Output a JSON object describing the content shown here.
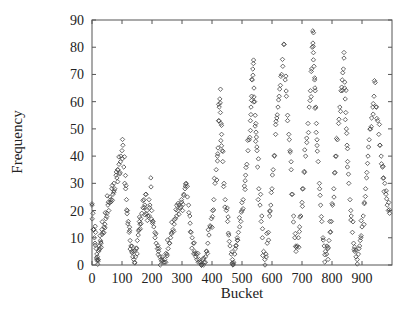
{
  "chart_data": {
    "type": "scatter",
    "title": "",
    "xlabel": "Bucket",
    "ylabel": "Frequency",
    "xlim": [
      0,
      1000
    ],
    "ylim": [
      0,
      90
    ],
    "xticks": [
      0,
      100,
      200,
      300,
      400,
      500,
      600,
      700,
      800,
      900
    ],
    "yticks": [
      0,
      10,
      20,
      30,
      40,
      50,
      60,
      70,
      80,
      90
    ],
    "grid": false,
    "legend": null,
    "marker": "open-diamond",
    "marker_color": "#444444",
    "peaks": [
      {
        "x": 100,
        "y": 44
      },
      {
        "x": 200,
        "y": 32
      },
      {
        "x": 330,
        "y": 30
      },
      {
        "x": 425,
        "y": 61
      },
      {
        "x": 535,
        "y": 74
      },
      {
        "x": 640,
        "y": 81
      },
      {
        "x": 735,
        "y": 86
      },
      {
        "x": 840,
        "y": 76
      },
      {
        "x": 945,
        "y": 67
      }
    ],
    "troughs": [
      {
        "x": 20,
        "y": 2
      },
      {
        "x": 140,
        "y": 1
      },
      {
        "x": 245,
        "y": 1
      },
      {
        "x": 365,
        "y": 0
      },
      {
        "x": 470,
        "y": 0
      },
      {
        "x": 570,
        "y": 2
      },
      {
        "x": 680,
        "y": 4
      },
      {
        "x": 785,
        "y": 4
      },
      {
        "x": 885,
        "y": 2
      }
    ],
    "series": [
      {
        "name": "frequency",
        "points": [
          [
            0,
            22
          ],
          [
            3,
            19
          ],
          [
            5,
            13
          ],
          [
            8,
            10
          ],
          [
            10,
            8
          ],
          [
            12,
            12
          ],
          [
            14,
            6
          ],
          [
            16,
            4
          ],
          [
            18,
            3
          ],
          [
            20,
            2
          ],
          [
            22,
            5
          ],
          [
            24,
            7
          ],
          [
            26,
            6
          ],
          [
            28,
            9
          ],
          [
            30,
            8
          ],
          [
            33,
            13
          ],
          [
            36,
            12
          ],
          [
            40,
            14
          ],
          [
            43,
            15
          ],
          [
            46,
            17
          ],
          [
            50,
            19
          ],
          [
            53,
            22
          ],
          [
            56,
            20
          ],
          [
            60,
            25
          ],
          [
            63,
            24
          ],
          [
            66,
            28
          ],
          [
            70,
            26
          ],
          [
            73,
            30
          ],
          [
            76,
            28
          ],
          [
            80,
            33
          ],
          [
            83,
            32
          ],
          [
            86,
            35
          ],
          [
            90,
            37
          ],
          [
            93,
            34
          ],
          [
            96,
            40
          ],
          [
            100,
            42
          ],
          [
            103,
            44
          ],
          [
            106,
            36
          ],
          [
            109,
            30
          ],
          [
            112,
            28
          ],
          [
            115,
            24
          ],
          [
            118,
            20
          ],
          [
            121,
            16
          ],
          [
            124,
            12
          ],
          [
            127,
            9
          ],
          [
            130,
            7
          ],
          [
            133,
            5
          ],
          [
            136,
            3
          ],
          [
            139,
            2
          ],
          [
            142,
            1
          ],
          [
            145,
            3
          ],
          [
            148,
            6
          ],
          [
            151,
            9
          ],
          [
            154,
            11
          ],
          [
            157,
            13
          ],
          [
            160,
            15
          ],
          [
            163,
            17
          ],
          [
            166,
            19
          ],
          [
            170,
            21
          ],
          [
            173,
            24
          ],
          [
            176,
            22
          ],
          [
            180,
            26
          ],
          [
            183,
            20
          ],
          [
            186,
            18
          ],
          [
            190,
            24
          ],
          [
            193,
            22
          ],
          [
            196,
            32
          ],
          [
            199,
            20
          ],
          [
            202,
            16
          ],
          [
            206,
            14
          ],
          [
            210,
            10
          ],
          [
            214,
            8
          ],
          [
            218,
            6
          ],
          [
            222,
            5
          ],
          [
            226,
            3
          ],
          [
            230,
            2
          ],
          [
            234,
            3
          ],
          [
            238,
            1
          ],
          [
            242,
            2
          ],
          [
            246,
            1
          ],
          [
            250,
            4
          ],
          [
            254,
            6
          ],
          [
            258,
            8
          ],
          [
            262,
            10
          ],
          [
            266,
            12
          ],
          [
            270,
            13
          ],
          [
            274,
            15
          ],
          [
            278,
            17
          ],
          [
            282,
            18
          ],
          [
            286,
            20
          ],
          [
            290,
            22
          ],
          [
            294,
            21
          ],
          [
            298,
            24
          ],
          [
            302,
            20
          ],
          [
            306,
            26
          ],
          [
            310,
            28
          ],
          [
            314,
            30
          ],
          [
            318,
            25
          ],
          [
            322,
            22
          ],
          [
            326,
            18
          ],
          [
            330,
            12
          ],
          [
            334,
            10
          ],
          [
            338,
            8
          ],
          [
            342,
            5
          ],
          [
            346,
            3
          ],
          [
            350,
            2
          ],
          [
            354,
            1
          ],
          [
            358,
            2
          ],
          [
            362,
            1
          ],
          [
            366,
            0
          ],
          [
            370,
            2
          ],
          [
            374,
            1
          ],
          [
            378,
            3
          ],
          [
            382,
            5
          ],
          [
            386,
            8
          ],
          [
            390,
            11
          ],
          [
            394,
            14
          ],
          [
            398,
            17
          ],
          [
            402,
            20
          ],
          [
            406,
            24
          ],
          [
            410,
            30
          ],
          [
            414,
            35
          ],
          [
            418,
            40
          ],
          [
            420,
            43
          ],
          [
            422,
            53
          ],
          [
            424,
            58
          ],
          [
            426,
            61
          ],
          [
            428,
            56
          ],
          [
            430,
            52
          ],
          [
            432,
            48
          ],
          [
            434,
            42
          ],
          [
            436,
            38
          ],
          [
            440,
            30
          ],
          [
            444,
            24
          ],
          [
            448,
            20
          ],
          [
            452,
            16
          ],
          [
            456,
            11
          ],
          [
            460,
            7
          ],
          [
            464,
            4
          ],
          [
            468,
            2
          ],
          [
            470,
            0
          ],
          [
            472,
            1
          ],
          [
            476,
            4
          ],
          [
            480,
            7
          ],
          [
            484,
            10
          ],
          [
            488,
            12
          ],
          [
            492,
            14
          ],
          [
            496,
            16
          ],
          [
            500,
            20
          ],
          [
            504,
            24
          ],
          [
            508,
            29
          ],
          [
            512,
            33
          ],
          [
            516,
            37
          ],
          [
            520,
            42
          ],
          [
            524,
            46
          ],
          [
            528,
            53
          ],
          [
            530,
            58
          ],
          [
            532,
            62
          ],
          [
            534,
            68
          ],
          [
            536,
            72
          ],
          [
            538,
            74
          ],
          [
            540,
            65
          ],
          [
            542,
            60
          ],
          [
            544,
            55
          ],
          [
            546,
            52
          ],
          [
            548,
            47
          ],
          [
            550,
            42
          ],
          [
            552,
            36
          ],
          [
            556,
            28
          ],
          [
            560,
            22
          ],
          [
            564,
            16
          ],
          [
            568,
            10
          ],
          [
            572,
            5
          ],
          [
            576,
            2
          ],
          [
            580,
            4
          ],
          [
            584,
            8
          ],
          [
            588,
            12
          ],
          [
            592,
            18
          ],
          [
            596,
            22
          ],
          [
            600,
            28
          ],
          [
            604,
            35
          ],
          [
            608,
            40
          ],
          [
            612,
            48
          ],
          [
            616,
            54
          ],
          [
            620,
            58
          ],
          [
            624,
            62
          ],
          [
            628,
            66
          ],
          [
            632,
            70
          ],
          [
            636,
            73
          ],
          [
            640,
            81
          ],
          [
            644,
            68
          ],
          [
            648,
            62
          ],
          [
            652,
            55
          ],
          [
            656,
            48
          ],
          [
            660,
            42
          ],
          [
            664,
            35
          ],
          [
            668,
            26
          ],
          [
            672,
            18
          ],
          [
            676,
            10
          ],
          [
            680,
            5
          ],
          [
            684,
            7
          ],
          [
            688,
            10
          ],
          [
            692,
            14
          ],
          [
            696,
            18
          ],
          [
            700,
            23
          ],
          [
            704,
            28
          ],
          [
            708,
            34
          ],
          [
            712,
            40
          ],
          [
            716,
            45
          ],
          [
            720,
            52
          ],
          [
            724,
            58
          ],
          [
            728,
            64
          ],
          [
            732,
            72
          ],
          [
            734,
            80
          ],
          [
            736,
            86
          ],
          [
            738,
            78
          ],
          [
            740,
            73
          ],
          [
            742,
            68
          ],
          [
            744,
            64
          ],
          [
            746,
            58
          ],
          [
            748,
            52
          ],
          [
            750,
            46
          ],
          [
            754,
            38
          ],
          [
            758,
            30
          ],
          [
            762,
            22
          ],
          [
            766,
            16
          ],
          [
            770,
            10
          ],
          [
            774,
            7
          ],
          [
            778,
            5
          ],
          [
            782,
            4
          ],
          [
            786,
            6
          ],
          [
            790,
            9
          ],
          [
            794,
            12
          ],
          [
            798,
            16
          ],
          [
            802,
            22
          ],
          [
            806,
            28
          ],
          [
            810,
            34
          ],
          [
            814,
            40
          ],
          [
            818,
            46
          ],
          [
            822,
            52
          ],
          [
            826,
            58
          ],
          [
            830,
            64
          ],
          [
            834,
            68
          ],
          [
            838,
            72
          ],
          [
            840,
            76
          ],
          [
            842,
            65
          ],
          [
            844,
            61
          ],
          [
            846,
            56
          ],
          [
            848,
            50
          ],
          [
            850,
            44
          ],
          [
            852,
            38
          ],
          [
            856,
            30
          ],
          [
            860,
            24
          ],
          [
            864,
            18
          ],
          [
            868,
            12
          ],
          [
            872,
            8
          ],
          [
            876,
            5
          ],
          [
            880,
            3
          ],
          [
            884,
            2
          ],
          [
            888,
            4
          ],
          [
            892,
            7
          ],
          [
            896,
            10
          ],
          [
            900,
            14
          ],
          [
            904,
            18
          ],
          [
            908,
            23
          ],
          [
            912,
            28
          ],
          [
            916,
            34
          ],
          [
            920,
            40
          ],
          [
            924,
            46
          ],
          [
            928,
            50
          ],
          [
            932,
            54
          ],
          [
            936,
            58
          ],
          [
            940,
            62
          ],
          [
            944,
            67
          ],
          [
            948,
            58
          ],
          [
            952,
            53
          ],
          [
            956,
            48
          ],
          [
            960,
            44
          ],
          [
            964,
            40
          ],
          [
            968,
            36
          ],
          [
            972,
            32
          ],
          [
            976,
            30
          ],
          [
            980,
            26
          ],
          [
            984,
            22
          ],
          [
            988,
            20
          ],
          [
            992,
            19
          ]
        ]
      }
    ]
  }
}
